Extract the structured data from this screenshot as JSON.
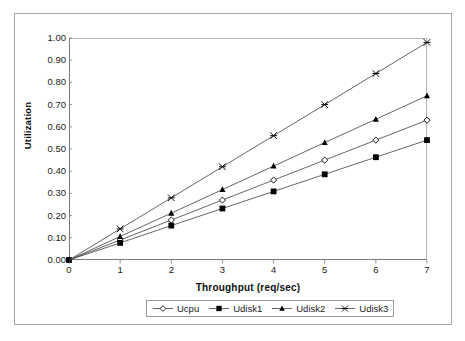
{
  "chart_data": {
    "type": "line",
    "title": "",
    "subtitle": "",
    "xlabel": "Throughput (req/sec)",
    "ylabel": "Utilization",
    "xlim": [
      0,
      7
    ],
    "ylim": [
      0,
      1.0
    ],
    "grid": false,
    "legend_position": "bottom",
    "x": [
      0,
      1,
      2,
      3,
      4,
      5,
      6,
      7
    ],
    "xtick_labels": [
      "0",
      "1",
      "2",
      "3",
      "4",
      "5",
      "6",
      "7"
    ],
    "ytick_labels": [
      "0.00",
      "0.10",
      "0.20",
      "0.30",
      "0.40",
      "0.50",
      "0.60",
      "0.70",
      "0.80",
      "0.90",
      "1.00"
    ],
    "ytick_values": [
      0.0,
      0.1,
      0.2,
      0.3,
      0.4,
      0.5,
      0.6,
      0.7,
      0.8,
      0.9,
      1.0
    ],
    "series": [
      {
        "name": "Ucpu",
        "marker": "open-diamond",
        "color": "#000000",
        "values": [
          0.0,
          0.09,
          0.18,
          0.27,
          0.36,
          0.45,
          0.54,
          0.63
        ]
      },
      {
        "name": "Udisk1",
        "marker": "filled-square",
        "color": "#000000",
        "values": [
          0.0,
          0.077,
          0.155,
          0.232,
          0.309,
          0.386,
          0.463,
          0.54
        ]
      },
      {
        "name": "Udisk2",
        "marker": "filled-triangle",
        "color": "#000000",
        "values": [
          0.0,
          0.106,
          0.211,
          0.317,
          0.423,
          0.529,
          0.634,
          0.74
        ]
      },
      {
        "name": "Udisk3",
        "marker": "star-x",
        "color": "#000000",
        "values": [
          0.0,
          0.14,
          0.28,
          0.42,
          0.56,
          0.7,
          0.84,
          0.98
        ]
      }
    ]
  },
  "legend": {
    "entries": [
      {
        "label": "Ucpu"
      },
      {
        "label": "Udisk1"
      },
      {
        "label": "Udisk2"
      },
      {
        "label": "Udisk3"
      }
    ]
  },
  "axes": {
    "x_title": "Throughput (req/sec)",
    "y_title": "Utilization"
  },
  "colors": {
    "line": "#555555",
    "marker": "#000000",
    "axis": "#7a7a7a",
    "frame": "#a8a8a8",
    "text": "#1a1a1a"
  }
}
